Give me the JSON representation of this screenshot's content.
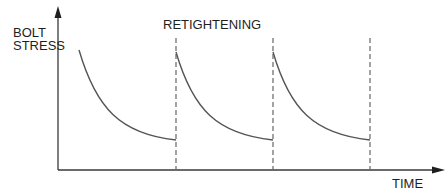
{
  "diagram": {
    "y_axis_label_lines": [
      "BOLT",
      "STRESS"
    ],
    "x_axis_label": "TIME",
    "annotation": "RETIGHTENING",
    "colors": {
      "axis": "#3a3a3a",
      "curve": "#555555",
      "dashed_line": "#666666",
      "text": "#1e1e1e",
      "background": "#ffffff"
    },
    "cycles": [
      {
        "start_x": 79,
        "end_x": 176,
        "start_y": 50,
        "end_y": 140
      },
      {
        "start_x": 176,
        "end_x": 273,
        "start_y": 52,
        "end_y": 140
      },
      {
        "start_x": 273,
        "end_x": 370,
        "start_y": 52,
        "end_y": 140
      }
    ],
    "retightening_lines_x": [
      176,
      273,
      370
    ]
  }
}
